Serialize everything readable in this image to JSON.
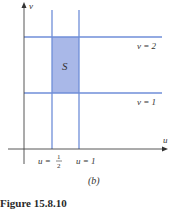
{
  "figure": {
    "caption": "Figure 15.8.10",
    "sublabel": "(b)"
  },
  "axes": {
    "x_label": "u",
    "y_label": "v"
  },
  "region": {
    "label": "S",
    "fill": "#a9b8e8",
    "line_color": "#6f8ed8"
  },
  "lines": {
    "v2": "v = 2",
    "v1": "v = 1",
    "u_half_prefix": "u =",
    "u_half_num": "1",
    "u_half_den": "2",
    "u1": "u = 1"
  }
}
